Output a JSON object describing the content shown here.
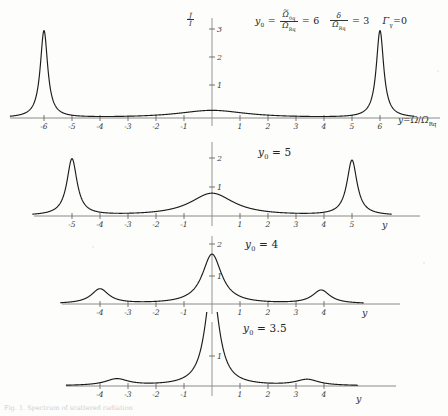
{
  "figure": {
    "y_axis_label": "J/I",
    "x_axis_label": "y = Ω/Ω_Rq",
    "x_axis_short": "y",
    "caption": "Fig. 1. Spectrum of scattered radiation"
  },
  "parameters": {
    "y0_symbol": "y",
    "y0_sub": "0",
    "y0_numerator": "Ω",
    "y0_numerator_sub": "0q",
    "y0_denominator": "Ω",
    "y0_denominator_sub": "Rq",
    "y0_value": "6",
    "delta_symbol": "δ",
    "delta_denominator": "Ω",
    "delta_denominator_sub": "Rq",
    "delta_value": "3",
    "gamma_symbol": "Γ",
    "gamma_sub": "γ",
    "gamma_value": "0"
  },
  "chart_data": [
    {
      "type": "line",
      "title": "y0 = 6",
      "panel_label": "y₀ = 6",
      "panel_index": 1,
      "xlabel": "y = Ω/Ω_Rq",
      "ylabel": "J/I",
      "xlim": [
        -6.9,
        6.9
      ],
      "ylim": [
        0,
        3.25
      ],
      "xticks": [
        -6,
        -5,
        -4,
        -3,
        -2,
        -1,
        1,
        2,
        3,
        4,
        5,
        6
      ],
      "xticklabels": [
        "-6",
        "-5",
        "-4",
        "-3",
        "-2",
        "-1",
        "1",
        "2",
        "3",
        "4",
        "5",
        "6"
      ],
      "yticks": [
        1,
        2,
        3
      ],
      "yticklabels": [
        "1",
        "2",
        "3"
      ],
      "grid": false,
      "legend": "none",
      "y0": 6,
      "peaks": [
        {
          "x": -6,
          "height": 3.0,
          "width": 0.16
        },
        {
          "x": 0,
          "height": 0.26,
          "width": 1.5
        },
        {
          "x": 6,
          "height": 3.0,
          "width": 0.16
        }
      ]
    },
    {
      "type": "line",
      "title": "y0 = 5",
      "panel_label": "y₀ = 5",
      "panel_index": 2,
      "xlabel": "y",
      "ylabel": "",
      "xlim": [
        -6.0,
        6.0
      ],
      "ylim": [
        0,
        2.3
      ],
      "xticks": [
        -5,
        -4,
        -3,
        -2,
        -1,
        1,
        2,
        3,
        4,
        5
      ],
      "xticklabels": [
        "-5",
        "-4",
        "-3",
        "-2",
        "-1",
        "1",
        "2",
        "3",
        "4",
        "5"
      ],
      "yticks": [
        1,
        2
      ],
      "yticklabels": [
        "1",
        "2"
      ],
      "grid": false,
      "legend": "none",
      "y0": 5,
      "peaks": [
        {
          "x": -5,
          "height": 1.95,
          "width": 0.22
        },
        {
          "x": 0,
          "height": 0.78,
          "width": 0.95
        },
        {
          "x": 5,
          "height": 1.9,
          "width": 0.22
        }
      ]
    },
    {
      "type": "line",
      "title": "y0 = 4",
      "panel_label": "y₀ = 4",
      "panel_index": 3,
      "xlabel": "y",
      "ylabel": "",
      "xlim": [
        -5.2,
        5.2
      ],
      "ylim": [
        0,
        2.1
      ],
      "xticks": [
        -4,
        -3,
        -2,
        -1,
        1,
        2,
        3,
        4
      ],
      "xticklabels": [
        "-4",
        "-3",
        "-2",
        "-1",
        "1",
        "2",
        "3",
        "4"
      ],
      "yticks": [
        1,
        2
      ],
      "yticklabels": [
        "1",
        "2"
      ],
      "grid": false,
      "legend": "none",
      "y0": 4,
      "peaks": [
        {
          "x": -4,
          "height": 0.46,
          "width": 0.38
        },
        {
          "x": 0,
          "height": 1.55,
          "width": 0.42
        },
        {
          "x": 3.9,
          "height": 0.42,
          "width": 0.38
        }
      ]
    },
    {
      "type": "line",
      "title": "y0 = 3.5",
      "panel_label": "y₀ = 3.5",
      "panel_index": 4,
      "xlabel": "y",
      "ylabel": "",
      "xlim": [
        -5.0,
        5.0
      ],
      "ylim": [
        0,
        2.6
      ],
      "xticks": [
        -4,
        -3,
        -2,
        -1,
        1,
        2,
        3,
        4
      ],
      "xticklabels": [
        "-4",
        "-3",
        "-2",
        "-1",
        "1",
        "2",
        "3",
        "4"
      ],
      "yticks": [
        1,
        2
      ],
      "yticklabels": [
        "1",
        "2"
      ],
      "grid": false,
      "legend": "none",
      "y0": 3.5,
      "peaks": [
        {
          "x": -3.4,
          "height": 0.22,
          "width": 0.5
        },
        {
          "x": 0,
          "height": 3.4,
          "width": 0.3
        },
        {
          "x": 3.4,
          "height": 0.2,
          "width": 0.5
        }
      ]
    }
  ]
}
